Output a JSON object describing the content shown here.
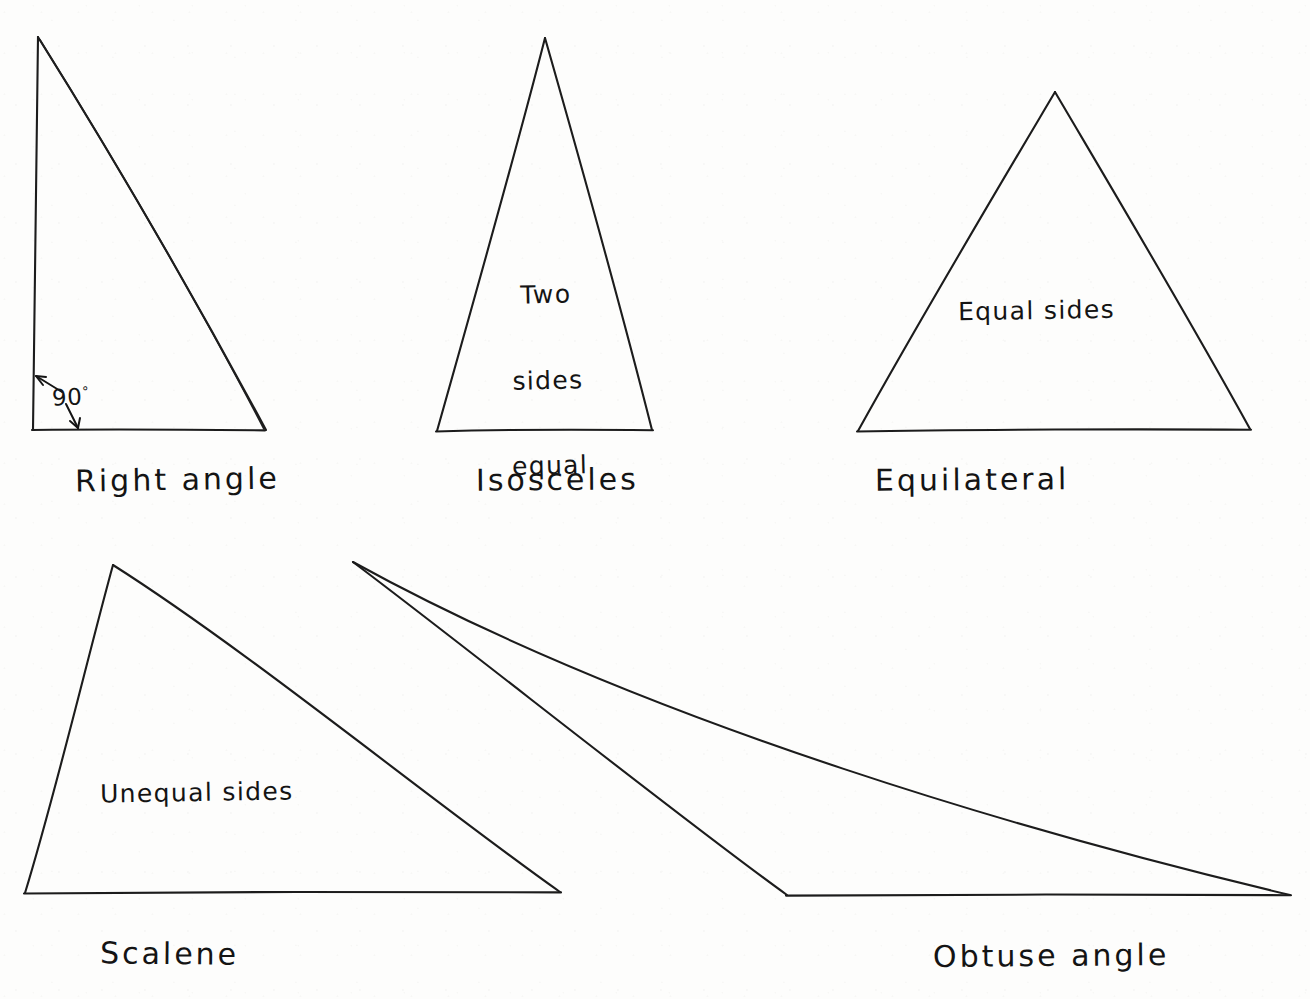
{
  "document": {
    "kind": "hand-drawn geometry diagram",
    "subject": "Types of triangles",
    "background_color": "#fdfdfc",
    "ink_color": "#1c1c1c"
  },
  "figures": [
    {
      "id": "right-angle",
      "caption": "Right angle",
      "inner_label": "",
      "annotation": "90",
      "annotation_suffix": "°",
      "vertices": [
        [
          38,
          37
        ],
        [
          33,
          430
        ],
        [
          265,
          430
        ]
      ],
      "caption_position": [
        75,
        462
      ],
      "annotation_position": [
        52,
        388
      ]
    },
    {
      "id": "isosceles",
      "caption": "Isosceles",
      "inner_label_lines": [
        "Two",
        "sides",
        "equal"
      ],
      "vertices": [
        [
          545,
          38
        ],
        [
          437,
          431
        ],
        [
          652,
          430
        ]
      ],
      "caption_position": [
        476,
        462
      ],
      "inner_label_position": [
        496,
        228
      ]
    },
    {
      "id": "equilateral",
      "caption": "Equilateral",
      "inner_label": "Equal sides",
      "vertices": [
        [
          1055,
          92
        ],
        [
          858,
          431
        ],
        [
          1250,
          429
        ]
      ],
      "caption_position": [
        875,
        462
      ],
      "inner_label_position": [
        958,
        296
      ]
    },
    {
      "id": "scalene",
      "caption": "Scalene",
      "inner_label": "Unequal sides",
      "vertices": [
        [
          113,
          565
        ],
        [
          25,
          893
        ],
        [
          560,
          892
        ]
      ],
      "caption_position": [
        100,
        936
      ],
      "inner_label_position": [
        100,
        778
      ]
    },
    {
      "id": "obtuse-angle",
      "caption": "Obtuse angle",
      "inner_label": "",
      "vertices": [
        [
          353,
          562
        ],
        [
          787,
          895
        ],
        [
          1290,
          895
        ]
      ],
      "caption_position": [
        933,
        938
      ]
    }
  ]
}
